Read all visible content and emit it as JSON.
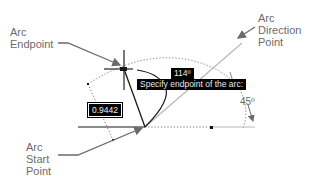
{
  "labels": {
    "arc_endpoint": "Arc\nEndpoint",
    "arc_direction_point": "Arc\nDirection\nPoint",
    "arc_start_point": "Arc\nStart\nPoint",
    "angle_45": "45º"
  },
  "tooltips": {
    "angle_value": "114º",
    "prompt": "Specify endpoint of the arc:"
  },
  "input": {
    "length_value": "0.9442"
  },
  "colors": {
    "line": "#1a1a1a",
    "gray_line": "#b0b0b0",
    "arrow": "#6b6b6b",
    "label_text": "#6b6b6b",
    "tooltip_bg": "#000000"
  }
}
